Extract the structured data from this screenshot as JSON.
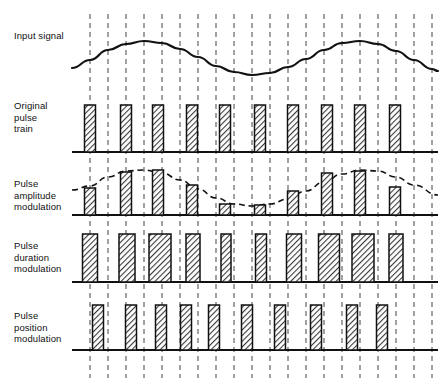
{
  "figure": {
    "colors": {
      "line": "#111111",
      "grid": "#555555",
      "pulse_fill": "#b0b0b0",
      "pulse_stroke": "#111111",
      "background": "#ffffff"
    },
    "plot_area": {
      "x_start": 72,
      "x_end": 438
    },
    "grid": {
      "count": 20,
      "dash": "5,4",
      "x_positions": [
        90,
        108,
        126,
        144,
        162,
        180,
        198,
        216,
        234,
        252,
        270,
        288,
        306,
        324,
        342,
        360,
        378,
        396,
        414,
        432
      ],
      "y_top": 14,
      "y_bottom": 378
    },
    "rows": [
      {
        "id": "input-signal",
        "label": "Input\nsignal",
        "baseline_y": 80,
        "type": "waveform"
      },
      {
        "id": "original-pulse-train",
        "label": "Original\npulse\ntrain",
        "baseline_y": 152,
        "type": "pulses"
      },
      {
        "id": "pulse-amplitude-modulation",
        "label": "Pulse\namplitude\nmodulation",
        "baseline_y": 215,
        "type": "pulses-envelope"
      },
      {
        "id": "pulse-duration-modulation",
        "label": "Pulse\nduration\nmodulation",
        "baseline_y": 282,
        "type": "pulses"
      },
      {
        "id": "pulse-position-modulation",
        "label": "Pulse\nposition\nmodulation",
        "baseline_y": 350,
        "type": "pulses"
      }
    ]
  },
  "chart_data": {
    "type": "line",
    "xlabel": "",
    "ylabel": "",
    "grid": true,
    "legend": "none",
    "series": [
      {
        "name": "Input signal",
        "description": "Sinusoidal modulating wave, one and a half cycles across the frame",
        "type": "sine",
        "amplitude": 28,
        "baseline_y": 80,
        "x_start": 72,
        "x_end": 438,
        "peaks_x": [
          145,
          350
        ],
        "trough_x": [
          245
        ],
        "samples_x": [
          72,
          90,
          108,
          126,
          144,
          162,
          180,
          198,
          216,
          234,
          252,
          270,
          288,
          306,
          324,
          342,
          360,
          378,
          396,
          414,
          432,
          438
        ],
        "samples_y": [
          68,
          60,
          50,
          44,
          41,
          43,
          49,
          57,
          66,
          72,
          75,
          73,
          67,
          59,
          50,
          43,
          41,
          44,
          51,
          60,
          69,
          71
        ]
      },
      {
        "name": "Original pulse train",
        "description": "Ten equal-amplitude, equal-width sampling pulses",
        "type": "pulse-train",
        "baseline_y": 152,
        "pulse_count": 10,
        "pulse_width": 11,
        "pulse_height": 47,
        "centers_x": [
          90,
          126,
          158,
          192,
          225,
          260,
          293,
          327,
          360,
          395
        ],
        "heights": [
          47,
          47,
          47,
          47,
          47,
          47,
          47,
          47,
          47,
          47
        ]
      },
      {
        "name": "Pulse amplitude modulation",
        "description": "Pulse heights follow the sine envelope; width and position fixed",
        "type": "pulse-train",
        "baseline_y": 215,
        "pulse_count": 10,
        "pulse_width": 11,
        "centers_x": [
          90,
          126,
          158,
          192,
          225,
          260,
          293,
          327,
          360,
          395
        ],
        "heights": [
          27,
          43,
          45,
          30,
          11,
          10,
          24,
          42,
          44,
          28
        ],
        "envelope": {
          "name": "Sine envelope",
          "style": "dashed",
          "amplitude": 22,
          "baseline_y": 215,
          "samples_x": [
            72,
            90,
            108,
            126,
            144,
            162,
            180,
            198,
            216,
            234,
            252,
            270,
            288,
            306,
            324,
            342,
            360,
            378,
            396,
            414,
            438
          ],
          "samples_y": [
            190,
            186,
            177,
            171,
            170,
            173,
            180,
            189,
            198,
            204,
            206,
            204,
            199,
            191,
            182,
            174,
            170,
            171,
            177,
            185,
            195
          ]
        }
      },
      {
        "name": "Pulse duration modulation",
        "description": "Pulse widths vary with signal amplitude; height and leading-edge timing fixed",
        "type": "pulse-train",
        "baseline_y": 282,
        "pulse_count": 10,
        "pulse_height": 48,
        "centers_x": [
          90,
          127,
          160,
          193,
          226,
          261,
          294,
          329,
          363,
          396
        ],
        "widths": [
          15,
          16,
          22,
          14,
          10,
          11,
          15,
          21,
          22,
          14
        ]
      },
      {
        "name": "Pulse position modulation",
        "description": "Pulse position shifts with signal amplitude; height and width fixed",
        "type": "pulse-train",
        "baseline_y": 350,
        "pulse_count": 10,
        "pulse_width": 11,
        "pulse_height": 45,
        "centers_x": [
          98,
          131,
          161,
          186,
          214,
          247,
          280,
          316,
          352,
          382
        ],
        "nominal_x": [
          90,
          126,
          158,
          192,
          225,
          260,
          293,
          327,
          360,
          395
        ]
      }
    ]
  }
}
